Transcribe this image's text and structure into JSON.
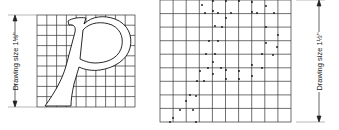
{
  "figure": {
    "left_panel": {
      "label": "Drawing size 1⅛\"",
      "grid": {
        "cols": 10,
        "rows": 9
      },
      "content": "outline letter p"
    },
    "right_panel": {
      "label": "Drawing size 1½\"",
      "grid": {
        "cols": 10,
        "rows": 9
      },
      "content": "dot plot transfer points of letter p"
    }
  }
}
